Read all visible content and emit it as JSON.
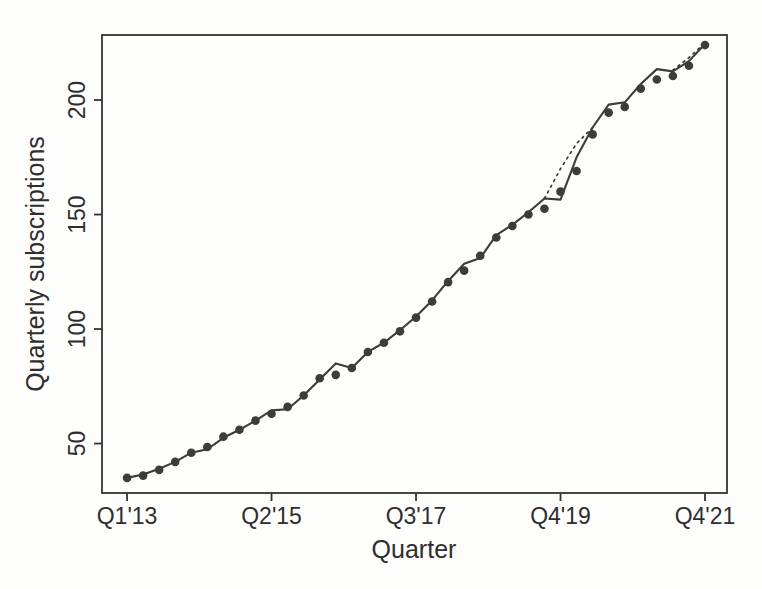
{
  "figure": {
    "kind": "scanned statistical plot",
    "background_color": "#fdfdfc",
    "ink_color": "#3c3c3c",
    "axis_color": "#333333"
  },
  "chart_data": {
    "type": "line",
    "title": "",
    "xlabel": "Quarter",
    "ylabel": "Quarterly subscriptions",
    "grid": "off",
    "legend": "none",
    "n_points": 37,
    "x_index_range": [
      -1.56,
      37.37
    ],
    "x_axis": {
      "tick_labels": [
        "Q1'13",
        "Q2'15",
        "Q3'17",
        "Q4'19",
        "Q4'21"
      ],
      "tick_indices": [
        0,
        9,
        18,
        27,
        36
      ]
    },
    "y_axis": {
      "tick_labels": [
        "50",
        "100",
        "150",
        "200"
      ],
      "tick_values": [
        50,
        100,
        150,
        200
      ],
      "range": [
        28.4,
        228.4
      ]
    },
    "series": [
      {
        "name": "observed-subscriptions",
        "style": "points",
        "marker": "filled-circle",
        "color": "#3c3c3c",
        "values": [
          35,
          36,
          38.5,
          42,
          46,
          48.5,
          53,
          56,
          60,
          63,
          66,
          71,
          78.5,
          80,
          83,
          90,
          94,
          99,
          105,
          112,
          120.5,
          125.5,
          132,
          140,
          145,
          150,
          152.5,
          160,
          169,
          185,
          194.5,
          197,
          205,
          209,
          210.5,
          215,
          224
        ]
      },
      {
        "name": "fitted-values",
        "style": "solid-line",
        "color": "#3c3c3c",
        "values": [
          35,
          36.5,
          39,
          42,
          46,
          47.5,
          52.5,
          56,
          60,
          64.5,
          65,
          71,
          78,
          85,
          83,
          90,
          94,
          99.5,
          105.5,
          112.5,
          121,
          128.5,
          131,
          141,
          145.5,
          151,
          157,
          156.5,
          175,
          188,
          198,
          199,
          207,
          213.5,
          212.5,
          217,
          224.5
        ]
      },
      {
        "name": "alternate-fit-dotted",
        "style": "dotted-line",
        "color": "#3c3c3c",
        "segments": [
          {
            "start_index": 26,
            "values": [
              157,
              170,
              181,
              188
            ]
          },
          {
            "start_index": 34,
            "values": [
              213,
              218.5,
              225
            ]
          }
        ]
      }
    ]
  }
}
